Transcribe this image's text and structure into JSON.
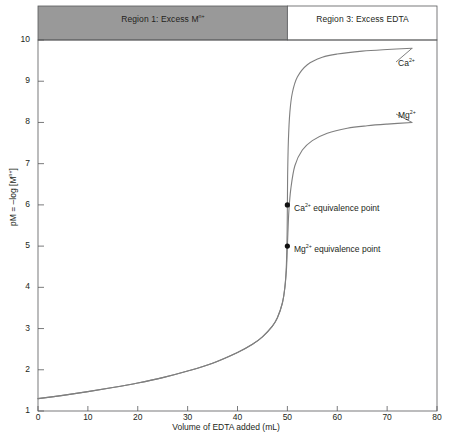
{
  "chart_data": {
    "type": "line",
    "title": "",
    "xlabel": "Volume of EDTA added (mL)",
    "ylabel": "pM = –log [Mⁿ⁺]",
    "ylabel_parts": {
      "prefix": "pM = –log [M",
      "sup": "n+",
      "suffix": "]"
    },
    "xlim": [
      0,
      80
    ],
    "ylim": [
      1,
      10
    ],
    "xticks": [
      0,
      10,
      20,
      30,
      40,
      50,
      60,
      70,
      80
    ],
    "yticks": [
      1,
      2,
      3,
      4,
      5,
      6,
      7,
      8,
      9,
      10
    ],
    "grid": false,
    "legend_position": "inline-right",
    "series": [
      {
        "name": "Ca2+",
        "label_prefix": "Ca",
        "label_sup": "2+",
        "color": "#7f7f7f",
        "x": [
          0,
          5,
          10,
          15,
          20,
          25,
          30,
          35,
          40,
          43,
          45,
          47,
          48,
          49,
          49.5,
          49.8,
          49.95,
          50,
          50.05,
          50.2,
          50.5,
          51,
          52,
          54,
          57,
          60,
          65,
          70,
          75
        ],
        "y": [
          1.3,
          1.38,
          1.47,
          1.57,
          1.68,
          1.81,
          1.97,
          2.16,
          2.42,
          2.62,
          2.8,
          3.06,
          3.26,
          3.62,
          4.0,
          4.55,
          5.35,
          6.0,
          6.7,
          7.55,
          8.25,
          8.72,
          9.1,
          9.4,
          9.58,
          9.66,
          9.73,
          9.77,
          9.8
        ]
      },
      {
        "name": "Mg2+",
        "label_prefix": "Mg",
        "label_sup": "2+",
        "color": "#7f7f7f",
        "x": [
          0,
          5,
          10,
          15,
          20,
          25,
          30,
          35,
          40,
          43,
          45,
          47,
          48,
          49,
          49.5,
          49.8,
          49.95,
          50,
          50.1,
          50.3,
          50.7,
          51.5,
          53,
          55,
          58,
          62,
          66,
          70,
          75
        ],
        "y": [
          1.3,
          1.38,
          1.47,
          1.57,
          1.68,
          1.81,
          1.97,
          2.16,
          2.42,
          2.62,
          2.8,
          3.06,
          3.26,
          3.62,
          4.0,
          4.4,
          4.8,
          5.0,
          5.3,
          5.85,
          6.4,
          6.95,
          7.33,
          7.56,
          7.74,
          7.86,
          7.92,
          7.96,
          8.0
        ]
      }
    ],
    "markers": [
      {
        "name": "ca-equivalence-point",
        "x": 50,
        "y": 6.0,
        "label_prefix": "Ca",
        "label_sup": "2+",
        "label_suffix": " equivalence point"
      },
      {
        "name": "mg-equivalence-point",
        "x": 50,
        "y": 5.0,
        "label_prefix": "Mg",
        "label_sup": "2+",
        "label_suffix": " equivalence point"
      }
    ],
    "regions": [
      {
        "name": "region-1",
        "label_prefix": "Region 1: Excess M",
        "label_sup": "n+",
        "label_suffix": "",
        "x_start": 0,
        "x_end": 50,
        "fill": "#999999"
      },
      {
        "name": "region-3",
        "label_prefix": "Region 3: Excess EDTA",
        "label_sup": "",
        "label_suffix": "",
        "x_start": 50,
        "x_end": 80,
        "fill": "#ffffff"
      }
    ],
    "colors": {
      "curve": "#7f7f7f",
      "axis": "#58595b",
      "text": "#231f20",
      "region_shade": "#999999",
      "background": "#ffffff"
    }
  }
}
